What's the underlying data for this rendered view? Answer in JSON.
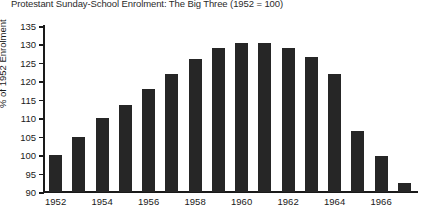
{
  "chart_data": {
    "type": "bar",
    "title": "Protestant Sunday-School Enrolment: The Big Three (1952 = 100)",
    "xlabel": "",
    "ylabel": "% of 1952 Enrolment",
    "ylim": [
      90,
      135
    ],
    "ytick_labels": [
      "90",
      "95",
      "100",
      "105",
      "110",
      "115",
      "120",
      "125",
      "130",
      "135"
    ],
    "ytick_values": [
      90,
      95,
      100,
      105,
      110,
      115,
      120,
      125,
      130,
      135
    ],
    "xtick_labels": [
      "1952",
      "1954",
      "1956",
      "1958",
      "1960",
      "1962",
      "1964",
      "1966"
    ],
    "xtick_values": [
      1952,
      1954,
      1956,
      1958,
      1960,
      1962,
      1964,
      1966
    ],
    "grid": false,
    "legend": null,
    "bar_color": "#262626",
    "categories": [
      "1952",
      "1953",
      "1954",
      "1955",
      "1956",
      "1957",
      "1958",
      "1959",
      "1960",
      "1961",
      "1962",
      "1963",
      "1964",
      "1965",
      "1966",
      "1967"
    ],
    "values": [
      100.0,
      105.0,
      110.0,
      113.5,
      118.0,
      122.0,
      126.0,
      129.0,
      130.5,
      130.5,
      129.0,
      126.5,
      122.0,
      106.5,
      99.8,
      92.5
    ]
  }
}
